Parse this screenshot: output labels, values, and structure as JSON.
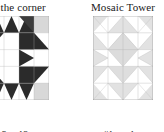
{
  "page": {
    "background_color": "#ffffff",
    "kind": "quilt-block-pattern-sheet"
  },
  "palette": {
    "dark": "#2b2b2b",
    "mid_dark": "#3d3d3d",
    "light_gray": "#d8d8d8",
    "pale_gray": "#e6e6e6",
    "white": "#ffffff",
    "grid_line": "#b4b4b4",
    "outline": "#9a9a9a",
    "text": "#111111"
  },
  "blocks": [
    {
      "id": "left-block",
      "title": "n the corner",
      "title_truncated": true,
      "grid": {
        "cols": 4,
        "rows": 5
      },
      "legend": [
        {
          "code": "3",
          "separator": "-",
          "qty": "12",
          "unit": "x"
        },
        {
          "code": "6",
          "separator": "-",
          "qty": "48",
          "unit": "x"
        }
      ]
    },
    {
      "id": "right-block",
      "title": "Mosaic Tower",
      "title_truncated": false,
      "grid": {
        "cols": 4,
        "rows": 5
      },
      "legend": [
        {
          "code": "#1",
          "separator": "-",
          "qty": "1",
          "unit": "x"
        },
        {
          "code": "#4",
          "separator": "-",
          "qty": "8",
          "unit": "x"
        }
      ]
    }
  ]
}
